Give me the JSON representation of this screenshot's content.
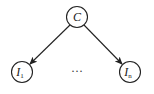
{
  "diagram": {
    "type": "directed-graph",
    "nodes": [
      {
        "id": "C",
        "label": "C",
        "subscript": "",
        "cx": 77,
        "cy": 17
      },
      {
        "id": "I1",
        "label": "I",
        "subscript": "1",
        "cx": 22,
        "cy": 72
      },
      {
        "id": "In",
        "label": "I",
        "subscript": "n",
        "cx": 130,
        "cy": 72
      }
    ],
    "edges": [
      {
        "from": "C",
        "to": "I1"
      },
      {
        "from": "C",
        "to": "In"
      }
    ],
    "ellipsis": "···",
    "colors": {
      "stroke": "#222222",
      "background": "#ffffff"
    }
  }
}
